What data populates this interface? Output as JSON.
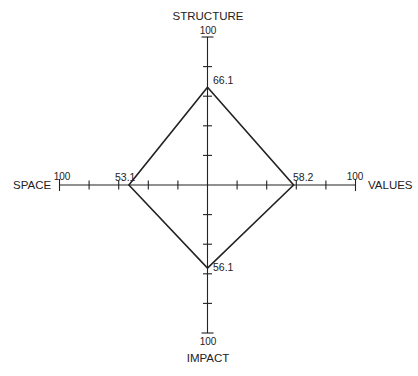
{
  "chart_data": {
    "type": "radar",
    "title": "",
    "axes": [
      "STRUCTURE",
      "VALUES",
      "IMPACT",
      "SPACE"
    ],
    "max": 100,
    "tick_step": 20,
    "series": [
      {
        "name": "",
        "values": [
          66.1,
          58.2,
          56.1,
          53.1
        ]
      }
    ],
    "axis_end_labels": [
      "100",
      "100",
      "100",
      "100"
    ],
    "value_labels": [
      "66.1",
      "58.2",
      "56.1",
      "53.1"
    ],
    "grid": false,
    "legend": "none"
  },
  "labels": {
    "top": "STRUCTURE",
    "right": "VALUES",
    "bottom": "IMPACT",
    "left": "SPACE",
    "max_top": "100",
    "max_right": "100",
    "max_bottom": "100",
    "max_left": "100",
    "val_top": "66.1",
    "val_right": "58.2",
    "val_bottom": "56.1",
    "val_left": "53.1"
  },
  "colors": {
    "line": "#222222",
    "background": "#ffffff"
  }
}
